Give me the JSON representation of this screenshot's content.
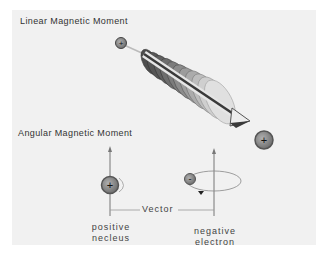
{
  "diagram": {
    "linear_section": {
      "title": "Linear Magnetic Moment",
      "particles": [
        {
          "charge": "+",
          "role": "incoming-positive-particle"
        },
        {
          "charge": "+",
          "role": "outgoing-positive-particle"
        }
      ]
    },
    "angular_section": {
      "title": "Angular Magnetic Moment",
      "vector_label": "Vector",
      "nucleus": {
        "charge": "+",
        "label_line1": "positive",
        "label_line2": "necleus"
      },
      "electron": {
        "charge": "-",
        "label_line1": "negative",
        "label_line2": "electron"
      }
    },
    "colors": {
      "background": "#f1f1f1",
      "particle_fill": "#8a8a8a",
      "particle_ring": "#555555",
      "coil_dark": "#5a5a5a",
      "coil_light": "#e8e8e8",
      "arrow": "#3a3a3a",
      "line": "#888888"
    }
  }
}
